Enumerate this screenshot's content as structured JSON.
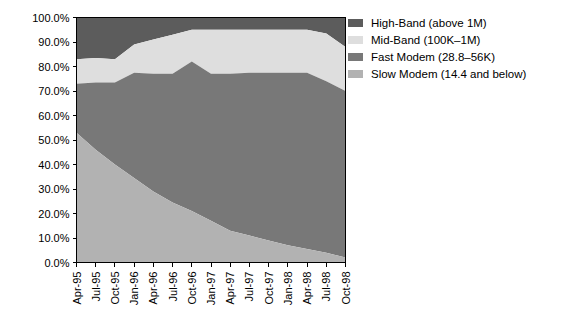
{
  "chart_data": {
    "type": "area",
    "title": "",
    "subtitle": "",
    "xlabel": "",
    "ylabel": "",
    "stacked": true,
    "stack_mode": "percent",
    "grid": false,
    "legend_position": "right",
    "ylim": [
      0,
      100
    ],
    "ytick_labels": [
      "0.0%",
      "10.0%",
      "20.0%",
      "30.0%",
      "40.0%",
      "50.0%",
      "60.0%",
      "70.0%",
      "80.0%",
      "90.0%",
      "100.0%"
    ],
    "ytick_values": [
      0,
      10,
      20,
      30,
      40,
      50,
      60,
      70,
      80,
      90,
      100
    ],
    "categories": [
      "Apr-95",
      "Jul-95",
      "Oct-95",
      "Jan-96",
      "Apr-96",
      "Jul-96",
      "Oct-96",
      "Jan-97",
      "Apr-97",
      "Jul-97",
      "Oct-97",
      "Jan-98",
      "Apr-98",
      "Jul-98",
      "Oct-98"
    ],
    "series": [
      {
        "name": "Slow Modem (14.4 and below)",
        "color": "#b2b2b2",
        "values": [
          53.0,
          46.0,
          40.0,
          34.5,
          29.0,
          24.5,
          21.0,
          17.0,
          13.0,
          11.0,
          9.0,
          7.0,
          5.5,
          4.0,
          2.0
        ]
      },
      {
        "name": "Fast Modem (28.8–56K)",
        "color": "#787878",
        "values": [
          20.0,
          27.5,
          33.5,
          43.0,
          48.0,
          52.5,
          61.0,
          60.0,
          64.0,
          66.5,
          68.5,
          70.5,
          72.0,
          70.0,
          68.0
        ]
      },
      {
        "name": "Mid-Band (100K–1M)",
        "color": "#dedede",
        "values": [
          10.0,
          10.0,
          9.5,
          11.5,
          14.0,
          16.0,
          13.0,
          18.0,
          18.0,
          17.5,
          17.5,
          17.5,
          17.5,
          19.5,
          18.0
        ]
      },
      {
        "name": "High-Band (above 1M)",
        "color": "#5c5c5c",
        "values": [
          17.0,
          16.5,
          17.0,
          11.0,
          9.0,
          7.0,
          5.0,
          5.0,
          5.0,
          5.0,
          5.0,
          5.0,
          5.0,
          6.5,
          12.0
        ]
      }
    ],
    "boundaries": {
      "slow_modem_top": [
        53.0,
        46.0,
        40.0,
        34.5,
        29.0,
        24.5,
        21.0,
        17.0,
        13.0,
        11.0,
        9.0,
        7.0,
        5.5,
        4.0,
        2.0
      ],
      "fast_modem_top": [
        73.0,
        73.5,
        73.5,
        77.5,
        77.0,
        77.0,
        82.0,
        77.0,
        77.0,
        77.5,
        77.5,
        77.5,
        77.5,
        74.0,
        70.0
      ],
      "mid_band_top": [
        83.0,
        83.5,
        83.0,
        89.0,
        91.0,
        93.0,
        95.0,
        95.0,
        95.0,
        95.0,
        95.0,
        95.0,
        95.0,
        93.5,
        88.0
      ],
      "high_band_top": [
        100,
        100,
        100,
        100,
        100,
        100,
        100,
        100,
        100,
        100,
        100,
        100,
        100,
        100,
        100
      ]
    },
    "legend": [
      {
        "label": "High-Band (above 1M)",
        "color": "#5c5c5c"
      },
      {
        "label": "Mid-Band (100K–1M)",
        "color": "#dedede"
      },
      {
        "label": "Fast Modem (28.8–56K)",
        "color": "#787878"
      },
      {
        "label": "Slow Modem (14.4 and below)",
        "color": "#b2b2b2"
      }
    ]
  }
}
